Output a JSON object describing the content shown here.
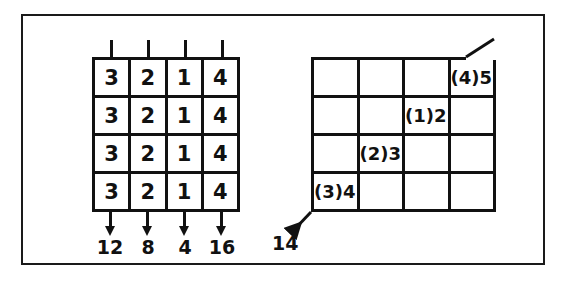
{
  "figure": {
    "background_color": "#ffffff",
    "line_color": "#111111",
    "frame_color": "#1a1a1a"
  },
  "left_grid": {
    "name": "value-grid",
    "rows": 4,
    "cols": 4,
    "cells": [
      [
        "3",
        "2",
        "1",
        "4"
      ],
      [
        "3",
        "2",
        "1",
        "4"
      ],
      [
        "3",
        "2",
        "1",
        "4"
      ],
      [
        "3",
        "2",
        "1",
        "4"
      ]
    ],
    "top_ticks": [
      "",
      "",
      "",
      ""
    ],
    "column_sums": [
      "12",
      "8",
      "4",
      "16"
    ],
    "arrow_direction": "down"
  },
  "right_grid": {
    "name": "diagonal-index-grid",
    "rows": 4,
    "cols": 4,
    "cells": [
      [
        "",
        "",
        "",
        "(4)5"
      ],
      [
        "",
        "",
        "(1)2",
        ""
      ],
      [
        "",
        "(2)3",
        "",
        ""
      ],
      [
        "(3)4",
        "",
        "",
        ""
      ]
    ],
    "diagonal_sum": "14",
    "diagonal_line_top_right": true,
    "diagonal_arrow_bottom_left": true
  }
}
